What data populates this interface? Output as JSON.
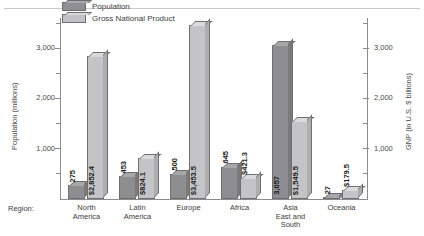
{
  "figure": {
    "caption_strip": "",
    "region_axis_tag": "Region:"
  },
  "legend": {
    "position": "top-left-inside",
    "entries": [
      {
        "label": "Population",
        "color": "#8e8e91",
        "series": "population"
      },
      {
        "label": "Gross National Product",
        "color": "#c4c4c7",
        "series": "gnp"
      }
    ]
  },
  "axes": {
    "left": {
      "title": "Population (millions)",
      "ticks": [
        "1,000",
        "2,000",
        "3,000"
      ],
      "tick_values": [
        1000,
        2000,
        3000
      ],
      "min": 0,
      "max": 3600
    },
    "right": {
      "title": "GNP (in U.S. $ billions)",
      "ticks": [
        "1,000",
        "2,000",
        "3,000"
      ],
      "tick_values": [
        1000,
        2000,
        3000
      ],
      "min": 0,
      "max": 3600
    }
  },
  "chart_data": {
    "type": "bar",
    "title": "",
    "subtitle": "",
    "xlabel": "Region:",
    "ylabel": "Population (millions)",
    "y2label": "GNP (in U.S. $ billions)",
    "ylim": [
      0,
      3600
    ],
    "y2lim": [
      0,
      3600
    ],
    "grid": false,
    "legend_position": "top-left",
    "categories": [
      "North America",
      "Latin America",
      "Europe",
      "Africa",
      "Asia East and South",
      "Oceania"
    ],
    "category_lines": [
      [
        "North",
        "America"
      ],
      [
        "Latin",
        "America"
      ],
      [
        "Europe"
      ],
      [
        "Africa"
      ],
      [
        "Asia",
        "East and",
        "South"
      ],
      [
        "Oceania"
      ]
    ],
    "series": [
      {
        "name": "Population",
        "unit": "millions",
        "color": "#8e8e91",
        "values": [
          275,
          453,
          500,
          645,
          3057,
          27
        ],
        "labels": [
          "275",
          "453",
          "500",
          "645",
          "3,057",
          "27"
        ]
      },
      {
        "name": "Gross National Product",
        "unit": "U.S. $ billions",
        "color": "#c4c4c7",
        "values": [
          2852.4,
          824.1,
          3453.5,
          421.3,
          1549.5,
          179.5
        ],
        "labels": [
          "$2,852.4",
          "$824.1",
          "$3,453.5",
          "$421.3",
          "$1,549.5",
          "$179.5"
        ]
      }
    ]
  }
}
